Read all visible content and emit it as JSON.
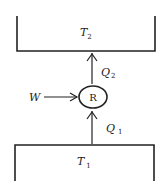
{
  "diagram": {
    "type": "heat-engine-reservoir-schematic",
    "hot_reservoir": {
      "symbol": "T",
      "subscript": "2"
    },
    "cold_reservoir": {
      "symbol": "T",
      "subscript": "1"
    },
    "device": {
      "label": "R"
    },
    "work_input": {
      "symbol": "W"
    },
    "heat_out": {
      "symbol": "Q",
      "subscript": "2"
    },
    "heat_in": {
      "symbol": "Q",
      "subscript": "1"
    },
    "colors": {
      "stroke": "#222222",
      "background": "#ffffff"
    }
  }
}
